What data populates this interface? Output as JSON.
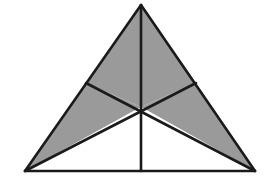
{
  "figure": {
    "type": "geometric-diagram",
    "canvas": {
      "width": 265,
      "height": 179,
      "background": "#ffffff"
    },
    "colors": {
      "shaded_fill": "#9a9a9a",
      "unshaded_fill": "#ffffff",
      "stroke": "#1a1a1a",
      "background": "#ffffff"
    },
    "stroke_width": 2.6,
    "vertices": {
      "apex": {
        "name": "A",
        "x": 141,
        "y": 5
      },
      "bottom_left": {
        "name": "B",
        "x": 25,
        "y": 171
      },
      "bottom_right": {
        "name": "C",
        "x": 255,
        "y": 171
      },
      "midpoint_left_side": {
        "name": "Mab",
        "x": 86,
        "y": 83
      },
      "midpoint_right_side": {
        "name": "Mac",
        "x": 196,
        "y": 83
      },
      "midpoint_base": {
        "name": "Mbc",
        "x": 141,
        "y": 171
      },
      "centroid": {
        "name": "G",
        "x": 141,
        "y": 107
      }
    },
    "regions": [
      {
        "id": "r1",
        "label": "top-left",
        "shaded": true,
        "points": "141,5 86,83 141,107"
      },
      {
        "id": "r2",
        "label": "top-right",
        "shaded": true,
        "points": "141,5 196,83 141,107"
      },
      {
        "id": "r3",
        "label": "left-upper-wedge",
        "shaded": true,
        "points": "86,83 25,171 141,107"
      },
      {
        "id": "r4",
        "label": "right-upper-wedge",
        "shaded": true,
        "points": "196,83 255,171 141,107"
      },
      {
        "id": "r5",
        "label": "bottom-left",
        "shaded": false,
        "points": "25,171 141,171 141,107"
      },
      {
        "id": "r6",
        "label": "bottom-right",
        "shaded": false,
        "points": "141,171 255,171 141,107"
      }
    ],
    "lines": [
      {
        "id": "edge-left",
        "label": "left-edge",
        "x1": 141,
        "y1": 5,
        "x2": 25,
        "y2": 171
      },
      {
        "id": "edge-right",
        "label": "right-edge",
        "x1": 141,
        "y1": 5,
        "x2": 255,
        "y2": 171
      },
      {
        "id": "edge-base",
        "label": "base-edge",
        "x1": 25,
        "y1": 171,
        "x2": 255,
        "y2": 171
      },
      {
        "id": "median-vertical",
        "label": "median-apex-to-base",
        "x1": 141,
        "y1": 5,
        "x2": 141,
        "y2": 171
      },
      {
        "id": "median-left",
        "label": "median-bottomright-to-leftmid",
        "x1": 255,
        "y1": 171,
        "x2": 86,
        "y2": 83
      },
      {
        "id": "median-right",
        "label": "median-bottomleft-to-rightmid",
        "x1": 25,
        "y1": 171,
        "x2": 196,
        "y2": 83
      }
    ]
  },
  "chart_data": {
    "type": "table",
    "categories": [
      "top-left",
      "top-right",
      "left-upper-wedge",
      "right-upper-wedge",
      "bottom-left",
      "bottom-right"
    ],
    "values": [
      1,
      1,
      1,
      1,
      0,
      0
    ],
    "legend": [
      "shaded = 1",
      "unshaded = 0"
    ]
  }
}
